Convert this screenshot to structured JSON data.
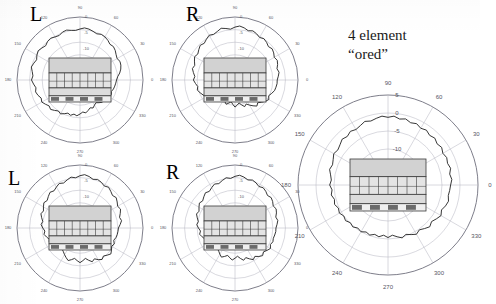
{
  "figure": {
    "background": "#ffffff",
    "width": 480,
    "height": 304,
    "annotation": {
      "line1": "4 element",
      "line2": "“ored”"
    }
  },
  "style": {
    "grid_color": "#b9b9c4",
    "outer_ring_color": "#6f6f7d",
    "trace_color": "#2b2b2b",
    "tick_label_color": "#55555f",
    "schematic_fill_top": "#d2d2d2",
    "schematic_fill_mid": "#e4e4e4",
    "schematic_fill_band": "#dcdcdc",
    "schematic_dark": "#6a6a6a",
    "schematic_stroke": "#3a3a3a"
  },
  "chart_data": [
    {
      "id": "plot-top-left",
      "type": "line",
      "coordinate_system": "polar",
      "title": "L",
      "title_position": "top-left",
      "xlabel": "Azimuth angle (degrees)",
      "ylabel": "Relative level (dB)",
      "grid": true,
      "legend": null,
      "angular_ticks": [
        0,
        30,
        60,
        90,
        120,
        150,
        180,
        210,
        240,
        270,
        300,
        330
      ],
      "angular_tick_labels": [
        "0",
        "30",
        "60",
        "90",
        "120",
        "150",
        "180",
        "210",
        "240",
        "270",
        "300",
        "330"
      ],
      "radial_ticks": [
        0,
        -5,
        -10
      ],
      "radial_tick_labels": [
        "0",
        "-5",
        "-10"
      ],
      "rlim": [
        -20,
        0
      ],
      "series": [
        {
          "name": "L pattern",
          "theta": [
            0,
            5,
            10,
            15,
            20,
            25,
            30,
            35,
            40,
            45,
            50,
            55,
            60,
            65,
            70,
            75,
            80,
            85,
            90,
            95,
            100,
            105,
            110,
            115,
            120,
            125,
            130,
            135,
            140,
            145,
            150,
            155,
            160,
            165,
            170,
            175,
            180,
            185,
            190,
            195,
            200,
            205,
            210,
            215,
            220,
            225,
            230,
            235,
            240,
            245,
            250,
            255,
            260,
            265,
            270,
            275,
            280,
            285,
            290,
            295,
            300,
            305,
            310,
            315,
            320,
            325,
            330,
            335,
            340,
            345,
            350,
            355
          ],
          "values": [
            -8.4,
            -8.0,
            -7.2,
            -6.6,
            -6.2,
            -6.0,
            -6.4,
            -6.0,
            -5.4,
            -5.0,
            -5.2,
            -4.6,
            -4.2,
            -4.0,
            -4.4,
            -4.0,
            -3.6,
            -3.4,
            -3.8,
            -4.2,
            -4.0,
            -3.6,
            -3.8,
            -4.4,
            -4.2,
            -3.8,
            -4.0,
            -4.6,
            -4.2,
            -3.8,
            -4.2,
            -4.8,
            -4.4,
            -4.0,
            -4.6,
            -5.0,
            -4.6,
            -5.2,
            -5.8,
            -5.4,
            -5.8,
            -6.4,
            -6.0,
            -6.6,
            -7.2,
            -6.8,
            -7.4,
            -8.0,
            -7.6,
            -8.2,
            -8.8,
            -8.4,
            -9.0,
            -8.6,
            -9.2,
            -9.8,
            -9.4,
            -10.0,
            -10.6,
            -10.2,
            -10.8,
            -11.2,
            -10.6,
            -10.0,
            -10.6,
            -10.2,
            -9.6,
            -9.0,
            -9.4,
            -9.0,
            -8.8,
            -8.6
          ]
        }
      ],
      "overlay": {
        "type": "floorplan-schematic",
        "rows": [
          "solid-block",
          "cell-grid",
          "band",
          "dark-bar"
        ],
        "cell_count": 8
      }
    },
    {
      "id": "plot-top-right",
      "type": "line",
      "coordinate_system": "polar",
      "title": "R",
      "title_position": "top-left",
      "xlabel": "Azimuth angle (degrees)",
      "ylabel": "Relative level (dB)",
      "grid": true,
      "legend": null,
      "angular_ticks": [
        0,
        30,
        60,
        90,
        120,
        150,
        180,
        210,
        240,
        270,
        300,
        330
      ],
      "angular_tick_labels": [
        "0",
        "30",
        "60",
        "90",
        "120",
        "150",
        "180",
        "210",
        "240",
        "270",
        "300",
        "330"
      ],
      "radial_ticks": [
        0,
        -5,
        -10
      ],
      "radial_tick_labels": [
        "0",
        "-5",
        "-10"
      ],
      "rlim": [
        -20,
        0
      ],
      "series": [
        {
          "name": "R pattern",
          "theta": [
            0,
            5,
            10,
            15,
            20,
            25,
            30,
            35,
            40,
            45,
            50,
            55,
            60,
            65,
            70,
            75,
            80,
            85,
            90,
            95,
            100,
            105,
            110,
            115,
            120,
            125,
            130,
            135,
            140,
            145,
            150,
            155,
            160,
            165,
            170,
            175,
            180,
            185,
            190,
            195,
            200,
            205,
            210,
            215,
            220,
            225,
            230,
            235,
            240,
            245,
            250,
            255,
            260,
            265,
            270,
            275,
            280,
            285,
            290,
            295,
            300,
            305,
            310,
            315,
            320,
            325,
            330,
            335,
            340,
            345,
            350,
            355
          ],
          "values": [
            -6.6,
            -6.2,
            -5.8,
            -6.2,
            -5.6,
            -5.2,
            -5.6,
            -5.0,
            -4.6,
            -5.0,
            -4.4,
            -4.0,
            -4.4,
            -3.8,
            -3.4,
            -3.8,
            -3.2,
            -2.8,
            -3.2,
            -3.8,
            -3.4,
            -3.0,
            -3.6,
            -4.0,
            -3.6,
            -4.2,
            -4.8,
            -4.4,
            -5.0,
            -5.6,
            -5.2,
            -5.8,
            -6.4,
            -6.0,
            -6.6,
            -7.2,
            -6.8,
            -7.4,
            -8.0,
            -7.6,
            -8.2,
            -8.8,
            -9.4,
            -10.0,
            -10.6,
            -11.2,
            -11.8,
            -12.4,
            -13.0,
            -12.4,
            -11.8,
            -12.4,
            -13.0,
            -12.2,
            -11.4,
            -12.0,
            -12.6,
            -11.8,
            -11.0,
            -11.6,
            -10.8,
            -10.0,
            -9.2,
            -9.8,
            -9.0,
            -8.2,
            -7.6,
            -8.2,
            -7.6,
            -7.0,
            -6.8,
            -6.6
          ]
        }
      ],
      "overlay": {
        "type": "floorplan-schematic",
        "rows": [
          "solid-block",
          "cell-grid",
          "band",
          "dark-bar"
        ],
        "cell_count": 8
      }
    },
    {
      "id": "plot-bottom-left",
      "type": "line",
      "coordinate_system": "polar",
      "title": "L",
      "title_position": "top-left",
      "xlabel": "Azimuth angle (degrees)",
      "ylabel": "Relative level (dB)",
      "grid": true,
      "legend": null,
      "angular_ticks": [
        0,
        30,
        60,
        90,
        120,
        150,
        180,
        210,
        240,
        270,
        300,
        330
      ],
      "angular_tick_labels": [
        "0",
        "30",
        "60",
        "90",
        "120",
        "150",
        "180",
        "210",
        "240",
        "270",
        "300",
        "330"
      ],
      "radial_ticks": [
        0,
        -5,
        -10
      ],
      "radial_tick_labels": [
        "0",
        "-5",
        "-10"
      ],
      "rlim": [
        -20,
        0
      ],
      "series": [
        {
          "name": "L pattern (lower)",
          "theta": [
            0,
            5,
            10,
            15,
            20,
            25,
            30,
            35,
            40,
            45,
            50,
            55,
            60,
            65,
            70,
            75,
            80,
            85,
            90,
            95,
            100,
            105,
            110,
            115,
            120,
            125,
            130,
            135,
            140,
            145,
            150,
            155,
            160,
            165,
            170,
            175,
            180,
            185,
            190,
            195,
            200,
            205,
            210,
            215,
            220,
            225,
            230,
            235,
            240,
            245,
            250,
            255,
            260,
            265,
            270,
            275,
            280,
            285,
            290,
            295,
            300,
            305,
            310,
            315,
            320,
            325,
            330,
            335,
            340,
            345,
            350,
            355
          ],
          "values": [
            -7.8,
            -7.2,
            -6.6,
            -7.0,
            -6.4,
            -5.8,
            -6.2,
            -5.6,
            -5.0,
            -5.4,
            -4.8,
            -4.2,
            -4.6,
            -4.0,
            -3.6,
            -4.0,
            -3.4,
            -3.0,
            -3.4,
            -4.0,
            -3.6,
            -4.2,
            -4.8,
            -4.4,
            -5.0,
            -5.6,
            -5.2,
            -5.8,
            -6.4,
            -6.0,
            -6.6,
            -7.2,
            -6.8,
            -7.4,
            -8.0,
            -7.6,
            -8.2,
            -8.8,
            -8.4,
            -9.0,
            -9.6,
            -9.2,
            -9.8,
            -10.4,
            -10.0,
            -10.6,
            -11.2,
            -10.8,
            -10.2,
            -9.6,
            -9.0,
            -9.6,
            -10.2,
            -9.6,
            -9.0,
            -9.6,
            -10.2,
            -9.4,
            -8.6,
            -9.2,
            -8.4,
            -7.8,
            -8.4,
            -7.8,
            -7.2,
            -7.8,
            -8.4,
            -8.0,
            -8.6,
            -8.2,
            -8.0,
            -7.9
          ]
        }
      ],
      "overlay": {
        "type": "floorplan-schematic",
        "rows": [
          "solid-block",
          "cell-grid",
          "band",
          "dark-bar"
        ],
        "cell_count": 8
      }
    },
    {
      "id": "plot-bottom-right",
      "type": "line",
      "coordinate_system": "polar",
      "title": "R",
      "title_position": "top-left",
      "xlabel": "Azimuth angle (degrees)",
      "ylabel": "Relative level (dB)",
      "grid": true,
      "legend": null,
      "angular_ticks": [
        0,
        30,
        60,
        90,
        120,
        150,
        180,
        210,
        240,
        270,
        300,
        330
      ],
      "angular_tick_labels": [
        "0",
        "30",
        "60",
        "90",
        "120",
        "150",
        "180",
        "210",
        "240",
        "270",
        "300",
        "330"
      ],
      "radial_ticks": [
        0,
        -5,
        -10
      ],
      "radial_tick_labels": [
        "0",
        "-5",
        "-10"
      ],
      "rlim": [
        -20,
        0
      ],
      "series": [
        {
          "name": "R pattern (lower)",
          "theta": [
            0,
            5,
            10,
            15,
            20,
            25,
            30,
            35,
            40,
            45,
            50,
            55,
            60,
            65,
            70,
            75,
            80,
            85,
            90,
            95,
            100,
            105,
            110,
            115,
            120,
            125,
            130,
            135,
            140,
            145,
            150,
            155,
            160,
            165,
            170,
            175,
            180,
            185,
            190,
            195,
            200,
            205,
            210,
            215,
            220,
            225,
            230,
            235,
            240,
            245,
            250,
            255,
            260,
            265,
            270,
            275,
            280,
            285,
            290,
            295,
            300,
            305,
            310,
            315,
            320,
            325,
            330,
            335,
            340,
            345,
            350,
            355
          ],
          "values": [
            -7.0,
            -6.6,
            -6.2,
            -6.6,
            -6.0,
            -5.6,
            -6.0,
            -5.4,
            -5.0,
            -5.4,
            -4.8,
            -4.4,
            -4.8,
            -4.2,
            -3.8,
            -4.2,
            -3.6,
            -3.2,
            -3.6,
            -4.2,
            -3.8,
            -4.4,
            -5.0,
            -4.6,
            -5.2,
            -5.8,
            -5.4,
            -6.0,
            -6.6,
            -6.2,
            -6.8,
            -7.4,
            -7.0,
            -7.6,
            -8.2,
            -7.8,
            -8.4,
            -9.0,
            -8.6,
            -9.2,
            -9.8,
            -9.4,
            -10.0,
            -10.6,
            -10.2,
            -10.8,
            -11.4,
            -11.0,
            -10.4,
            -9.8,
            -10.4,
            -11.0,
            -10.4,
            -9.8,
            -10.4,
            -11.0,
            -10.2,
            -9.4,
            -10.0,
            -9.2,
            -8.4,
            -9.0,
            -8.2,
            -7.6,
            -8.2,
            -7.6,
            -7.0,
            -7.6,
            -7.2,
            -7.4,
            -7.2,
            -7.0
          ]
        }
      ],
      "overlay": {
        "type": "floorplan-schematic",
        "rows": [
          "solid-block",
          "cell-grid",
          "band",
          "dark-bar"
        ],
        "cell_count": 8
      }
    },
    {
      "id": "plot-right-large",
      "type": "line",
      "coordinate_system": "polar",
      "title": "4 element “ored”",
      "title_position": "above",
      "xlabel": "Azimuth angle (degrees)",
      "ylabel": "Relative level (dB)",
      "grid": true,
      "legend": null,
      "angular_ticks": [
        0,
        30,
        60,
        90,
        120,
        150,
        180,
        210,
        240,
        270,
        300,
        330
      ],
      "angular_tick_labels": [
        "0",
        "30",
        "60",
        "90",
        "120",
        "150",
        "180",
        "210",
        "240",
        "270",
        "300",
        "330"
      ],
      "radial_ticks": [
        5,
        0,
        -5,
        -10
      ],
      "radial_tick_labels": [
        "5",
        "0",
        "-5",
        "-10"
      ],
      "rlim": [
        -20,
        5
      ],
      "series": [
        {
          "name": "4 element ored pattern",
          "theta": [
            0,
            5,
            10,
            15,
            20,
            25,
            30,
            35,
            40,
            45,
            50,
            55,
            60,
            65,
            70,
            75,
            80,
            85,
            90,
            95,
            100,
            105,
            110,
            115,
            120,
            125,
            130,
            135,
            140,
            145,
            150,
            155,
            160,
            165,
            170,
            175,
            180,
            185,
            190,
            195,
            200,
            205,
            210,
            215,
            220,
            225,
            230,
            235,
            240,
            245,
            250,
            255,
            260,
            265,
            270,
            275,
            280,
            285,
            290,
            295,
            300,
            305,
            310,
            315,
            320,
            325,
            330,
            335,
            340,
            345,
            350,
            355
          ],
          "values": [
            -2.6,
            -2.2,
            -2.6,
            -2.0,
            -2.4,
            -2.0,
            -2.4,
            -1.8,
            -2.2,
            -1.6,
            -2.0,
            -1.4,
            -1.8,
            -1.2,
            -1.6,
            -1.0,
            -1.4,
            -0.8,
            -1.2,
            -0.8,
            -1.2,
            -1.6,
            -1.2,
            -1.8,
            -2.2,
            -1.8,
            -2.4,
            -2.0,
            -2.6,
            -3.0,
            -2.6,
            -3.2,
            -3.6,
            -3.2,
            -3.8,
            -4.2,
            -3.8,
            -4.4,
            -4.0,
            -4.6,
            -4.2,
            -4.8,
            -4.4,
            -5.0,
            -4.6,
            -5.2,
            -4.8,
            -5.4,
            -5.0,
            -5.6,
            -5.2,
            -5.8,
            -5.4,
            -6.0,
            -5.4,
            -6.0,
            -5.4,
            -4.8,
            -5.4,
            -4.8,
            -4.2,
            -4.8,
            -4.2,
            -3.6,
            -4.2,
            -3.6,
            -3.0,
            -3.6,
            -3.0,
            -2.6,
            -3.0,
            -2.8
          ]
        }
      ],
      "overlay": {
        "type": "floorplan-schematic",
        "rows": [
          "solid-block",
          "cell-grid",
          "band",
          "dark-bar"
        ],
        "cell_count": 8
      }
    }
  ]
}
